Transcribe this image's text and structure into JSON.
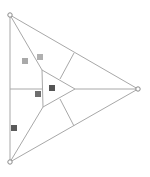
{
  "diagram": {
    "width": 150,
    "height": 177,
    "line_color": "#a8a8a8",
    "background": "#ffffff",
    "vertices": [
      {
        "name": "top-left-vertex",
        "x": 10,
        "y": 15
      },
      {
        "name": "bottom-left-vertex",
        "x": 10,
        "y": 162
      },
      {
        "name": "right-vertex",
        "x": 138,
        "y": 89
      }
    ],
    "inner_triangle": [
      {
        "x": 42,
        "y": 70
      },
      {
        "x": 43,
        "y": 107
      },
      {
        "x": 75,
        "y": 89
      }
    ],
    "segments": [
      {
        "name": "outer-left-edge",
        "x1": 10,
        "y1": 15,
        "x2": 10,
        "y2": 162
      },
      {
        "name": "outer-top-edge",
        "x1": 10,
        "y1": 15,
        "x2": 138,
        "y2": 89
      },
      {
        "name": "outer-bottom-edge",
        "x1": 10,
        "y1": 162,
        "x2": 138,
        "y2": 89
      },
      {
        "name": "top-vertex-to-inner",
        "x1": 10,
        "y1": 15,
        "x2": 42,
        "y2": 70
      },
      {
        "name": "bottom-vertex-to-inner",
        "x1": 10,
        "y1": 162,
        "x2": 43,
        "y2": 107
      },
      {
        "name": "left-midline",
        "x1": 10,
        "y1": 89,
        "x2": 42,
        "y2": 89
      },
      {
        "name": "right-midline",
        "x1": 75,
        "y1": 89,
        "x2": 138,
        "y2": 89
      },
      {
        "name": "upper-connector",
        "x1": 60,
        "y1": 79,
        "x2": 74,
        "y2": 53
      },
      {
        "name": "lower-connector",
        "x1": 60,
        "y1": 99,
        "x2": 74,
        "y2": 126
      }
    ],
    "markers": [
      {
        "name": "marker-light-1",
        "x": 22,
        "y": 58,
        "size": 6,
        "color": "#a9a9a9"
      },
      {
        "name": "marker-light-2",
        "x": 37,
        "y": 54,
        "size": 6,
        "color": "#b0b0b0"
      },
      {
        "name": "marker-dark-center",
        "x": 49,
        "y": 85,
        "size": 6,
        "color": "#555555"
      },
      {
        "name": "marker-medium",
        "x": 35,
        "y": 91,
        "size": 6,
        "color": "#6e6e6e"
      },
      {
        "name": "marker-dark-bottom",
        "x": 11,
        "y": 125,
        "size": 6,
        "color": "#5a5a5a"
      }
    ]
  }
}
